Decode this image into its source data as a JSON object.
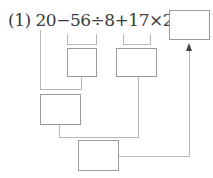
{
  "problem": {
    "label": "(1)",
    "expression": "20−56÷8+17×2=",
    "tokens": [
      "20",
      "−",
      "56",
      "÷",
      "8",
      "+",
      "17",
      "×",
      "2",
      "="
    ]
  },
  "boxes": [
    {
      "id": "answer",
      "value": ""
    },
    {
      "id": "step-division",
      "value": ""
    },
    {
      "id": "step-multiplication",
      "value": ""
    },
    {
      "id": "step-subtraction",
      "value": ""
    },
    {
      "id": "step-addition",
      "value": ""
    }
  ]
}
